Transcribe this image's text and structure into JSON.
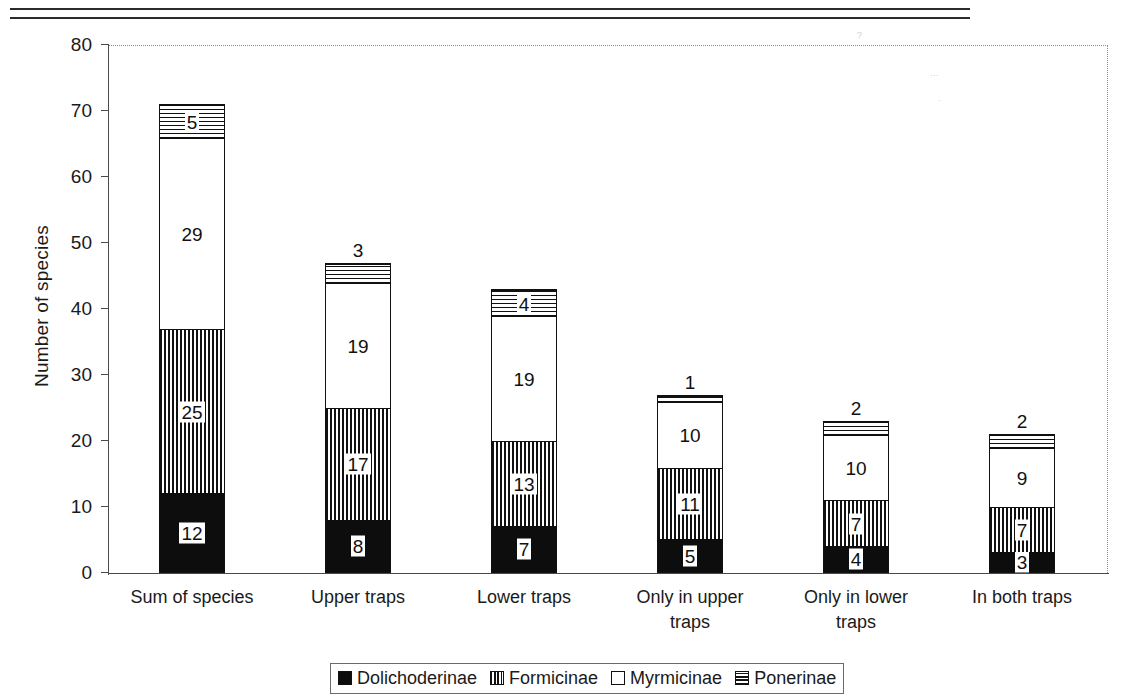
{
  "chart_data": {
    "type": "bar",
    "stacked": true,
    "title": "",
    "xlabel": "",
    "ylabel": "Number of species",
    "ylim": [
      0,
      80
    ],
    "ytick_step": 10,
    "yticks": [
      80,
      70,
      60,
      50,
      40,
      30,
      20,
      10,
      0
    ],
    "grid": false,
    "legend_position": "bottom",
    "categories": [
      "Sum of species",
      "Upper traps",
      "Lower traps",
      "Only in upper traps",
      "Only in lower traps",
      "In both traps"
    ],
    "category_lines": [
      [
        "Sum of species"
      ],
      [
        "Upper traps"
      ],
      [
        "Lower traps"
      ],
      [
        "Only in upper",
        "traps"
      ],
      [
        "Only in lower",
        "traps"
      ],
      [
        "In both traps"
      ]
    ],
    "series": [
      {
        "name": "Dolichoderinae",
        "pattern": "solid-black",
        "values": [
          12,
          8,
          7,
          5,
          4,
          3
        ]
      },
      {
        "name": "Formicinae",
        "pattern": "vertical-stripes",
        "values": [
          25,
          17,
          13,
          11,
          7,
          7
        ]
      },
      {
        "name": "Myrmicinae",
        "pattern": "white",
        "values": [
          29,
          19,
          19,
          10,
          10,
          9
        ]
      },
      {
        "name": "Ponerinae",
        "pattern": "horizontal-stripes",
        "values": [
          5,
          3,
          4,
          1,
          2,
          2
        ]
      }
    ],
    "totals": [
      71,
      47,
      43,
      27,
      23,
      21
    ],
    "label_outside": [
      [
        false,
        false,
        false,
        false
      ],
      [
        false,
        false,
        false,
        true
      ],
      [
        false,
        false,
        false,
        false
      ],
      [
        false,
        false,
        false,
        true
      ],
      [
        false,
        false,
        false,
        true
      ],
      [
        false,
        false,
        false,
        true
      ]
    ]
  },
  "legend": {
    "items": [
      {
        "label": "Dolichoderinae",
        "swatch": "solid-black-swatch"
      },
      {
        "label": "Formicinae",
        "swatch": "vertical-stripes-swatch"
      },
      {
        "label": "Myrmicinae",
        "swatch": "white-swatch"
      },
      {
        "label": "Ponerinae",
        "swatch": "horizontal-stripes-swatch"
      }
    ]
  },
  "colors": {
    "ink": "#111111",
    "axis": "#4a4a4a",
    "grid_dotted": "#8d8d8d",
    "background": "#ffffff"
  }
}
